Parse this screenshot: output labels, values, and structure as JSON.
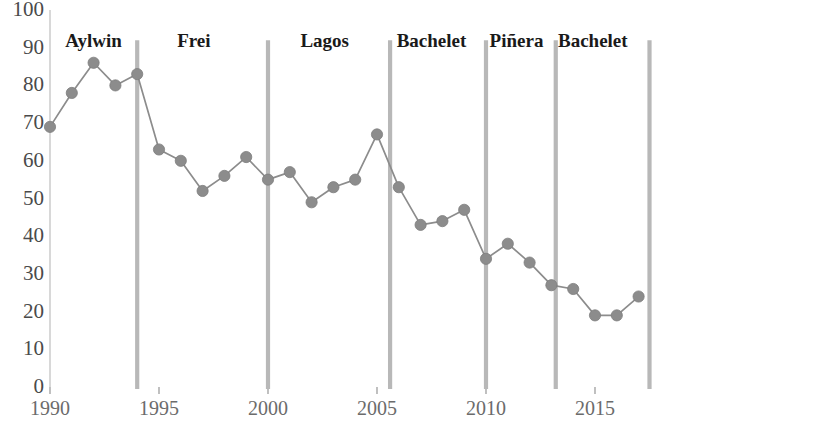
{
  "chart_data": {
    "type": "line",
    "title": "",
    "subtitle": "",
    "xlabel": "",
    "ylabel": "",
    "xlim": [
      1989.5,
      2017.5
    ],
    "ylim": [
      0,
      100
    ],
    "grid": false,
    "legend_position": "none",
    "marker": "circle",
    "series_color": "#8c8c8c",
    "x": [
      1990,
      1991,
      1992,
      1993,
      1994,
      1995,
      1996,
      1997,
      1998,
      1999,
      2000,
      2001,
      2002,
      2003,
      2004,
      2005,
      2006,
      2007,
      2008,
      2009,
      2010,
      2011,
      2012,
      2013,
      2014,
      2015,
      2016,
      2017
    ],
    "series": [
      {
        "name": "Approval",
        "values": [
          69,
          78,
          86,
          80,
          83,
          63,
          60,
          52,
          56,
          61,
          55,
          57,
          49,
          53,
          55,
          67,
          53,
          43,
          44,
          47,
          34,
          38,
          33,
          27,
          26,
          19,
          19,
          24
        ]
      }
    ],
    "ytick_labels": [
      "0",
      "10",
      "20",
      "30",
      "40",
      "50",
      "60",
      "70",
      "80",
      "90",
      "100"
    ],
    "ytick_values": [
      0,
      10,
      20,
      30,
      40,
      50,
      60,
      70,
      80,
      90,
      100
    ],
    "xtick_labels": [
      "1990",
      "1995",
      "2000",
      "2005",
      "2010",
      "2015"
    ],
    "xtick_values": [
      1990,
      1995,
      2000,
      2005,
      2010,
      2015
    ],
    "annotations": [
      {
        "label": "Aylwin",
        "x_start": 1990,
        "x_end": 1994.0,
        "label_x": 1992.0
      },
      {
        "label": "Frei",
        "x_start": 1994.0,
        "x_end": 2000.0,
        "label_x": 1996.6
      },
      {
        "label": "Lagos",
        "x_start": 2000.0,
        "x_end": 2005.6,
        "label_x": 2002.6
      },
      {
        "label": "Bachelet",
        "x_start": 2005.6,
        "x_end": 2010.0,
        "label_x": 2007.5
      },
      {
        "label": "Piñera",
        "x_start": 2010.0,
        "x_end": 2013.2,
        "label_x": 2011.4
      },
      {
        "label": "Bachelet",
        "x_start": 2013.2,
        "x_end": 2017.5,
        "label_x": 2014.9
      }
    ],
    "dividers": [
      1994.0,
      2000.0,
      2005.6,
      2010.0,
      2013.2,
      2017.5
    ],
    "divider_color": "#b8b8b8",
    "axis_color": "#cfcfcf"
  }
}
